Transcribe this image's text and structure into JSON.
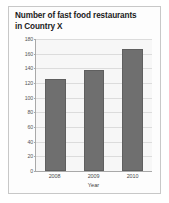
{
  "chart_data": {
    "type": "bar",
    "title": "Number of fast food restaurants in Country X",
    "title_line1": "Number of fast food restaurants",
    "title_line2": "in Country X",
    "categories": [
      "2008",
      "2009",
      "2010"
    ],
    "values": [
      126,
      138,
      167
    ],
    "xlabel": "Year",
    "ylabel": "",
    "ylim": [
      0,
      180
    ],
    "ytick_step": 20,
    "yticks": [
      0,
      20,
      40,
      60,
      80,
      100,
      120,
      140,
      160,
      180
    ],
    "grid": true,
    "legend": false,
    "legend_position": "none",
    "series": [
      {
        "name": "Number of fast food restaurants",
        "values": [
          126,
          138,
          167
        ]
      }
    ],
    "colors": {
      "bar": "#6f6f6f",
      "bar_border": "#5f5f5f",
      "plot_background": "#f7f7f7",
      "gridline": "#dcdcdc",
      "axis": "#a9a9a9",
      "title_text": "#1b1b1b",
      "tick_text": "#555555",
      "card_border": "#c8c8c8",
      "card_background": "#fdfdfd"
    }
  }
}
